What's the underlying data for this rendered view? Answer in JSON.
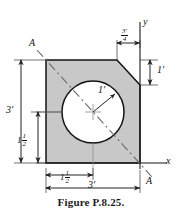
{
  "figure": {
    "caption": "Figure P.8.25.",
    "axes": {
      "y_label": "y",
      "x_label": "x"
    },
    "section_labels": {
      "top": "A",
      "bottom": "A"
    },
    "dimensions": {
      "left_overall": "3'",
      "left_partial_whole": "1",
      "left_partial_num": "1",
      "left_partial_den": "2",
      "left_partial_prime": "'",
      "bottom_overall": "3'",
      "bottom_partial_whole": "1",
      "bottom_partial_num": "1",
      "bottom_partial_den": "2",
      "bottom_partial_prime": "'",
      "chamfer_horizontal_num": "3'",
      "chamfer_horizontal_den": "4",
      "chamfer_vertical": "1'",
      "circle_radius": "1'"
    },
    "colors": {
      "body_fill": "#c8c8c8",
      "outline": "#131313",
      "dimension_line": "#2a2a2a",
      "section_line": "#555555",
      "hole_fill": "#ffffff",
      "text": "#131313",
      "background": "#ffffff"
    },
    "geometry": {
      "square_left": 46,
      "square_right": 140,
      "square_top": 60,
      "square_bottom": 163,
      "chamfer_top_x": 117,
      "chamfer_right_y": 85,
      "hole_center_x": 93,
      "hole_center_y": 112,
      "hole_radius": 31,
      "note": "3 ft square, 3/4 ft x 1 ft chamfer at top right, 1 ft radius hole centered at (1.5 ft, 1.5 ft)"
    }
  }
}
